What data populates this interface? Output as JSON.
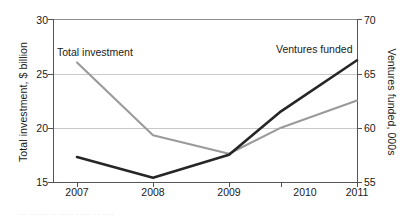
{
  "chart_data": {
    "type": "line",
    "title": "",
    "subtitle": "",
    "xlabel": "",
    "categories": [
      "2007",
      "2008",
      "2009",
      "2010",
      "2011"
    ],
    "x": [
      2007,
      2008,
      2009,
      2010,
      2011
    ],
    "grid": true,
    "legend_position": "inline-annotations",
    "series": [
      {
        "name": "Total investment",
        "axis": "left",
        "color": "#9a9a9a",
        "unit": "$ billion",
        "values": [
          26.0,
          19.3,
          17.6,
          20.0,
          22.5
        ]
      },
      {
        "name": "Ventures funded",
        "axis": "right",
        "color": "#262626",
        "unit": "000s",
        "values": [
          57.3,
          55.4,
          57.5,
          61.5,
          66.2
        ]
      }
    ],
    "axes": {
      "left": {
        "label": "Total investment, $ billion",
        "ticks": [
          15,
          20,
          25,
          30
        ],
        "tick_labels": [
          "15",
          "20",
          "25",
          "30"
        ],
        "lim": [
          15,
          30
        ]
      },
      "right": {
        "label": "Ventures funded, 000s",
        "ticks": [
          55,
          60,
          65,
          70
        ],
        "tick_labels": [
          "55",
          "60",
          "65",
          "70"
        ],
        "lim": [
          55,
          70
        ]
      },
      "bottom": {
        "label": "",
        "tick_labels": [
          "2007",
          "2008",
          "2009",
          "2010",
          "2011"
        ]
      }
    },
    "gridlines_left": [
      20,
      25
    ],
    "annotations": [
      {
        "text": "Total investment",
        "series": "Total investment"
      },
      {
        "text": "Ventures funded",
        "series": "Ventures funded"
      }
    ]
  },
  "caption": {
    "cropped_text": "··· ······ ·· ····· ····· ·· ····"
  },
  "colors": {
    "total_investment": "#9a9a9a",
    "ventures_funded": "#262626",
    "gridline": "#c9c9c9",
    "axis": "#555555",
    "background": "#ffffff"
  }
}
